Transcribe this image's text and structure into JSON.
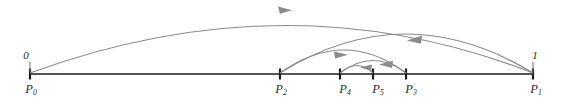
{
  "figure": {
    "name": "parameter-interval-subdivision-diagram",
    "width": 566,
    "height": 104,
    "background": "#ffffff",
    "axis_color": "#1c1c1c",
    "arc_color": "#8a8a8a",
    "label_color": "#2b2b2b"
  },
  "axis": {
    "y": 74,
    "x_start": 30,
    "x_end": 534
  },
  "points": [
    {
      "id": "P0",
      "base": "P",
      "subscript": "0",
      "label": "P₀",
      "x": 30,
      "value_label": "0",
      "has_value_label": true
    },
    {
      "id": "P2",
      "base": "P",
      "subscript": "2",
      "label": "P₂",
      "x": 280,
      "value_label": "",
      "has_value_label": false
    },
    {
      "id": "P4",
      "base": "P",
      "subscript": "4",
      "label": "P₄",
      "x": 340,
      "value_label": "",
      "has_value_label": false
    },
    {
      "id": "P5",
      "base": "P",
      "subscript": "5",
      "label": "P₅",
      "x": 373,
      "value_label": "",
      "has_value_label": false
    },
    {
      "id": "P3",
      "base": "P",
      "subscript": "3",
      "label": "P₃",
      "x": 406,
      "value_label": "",
      "has_value_label": false
    },
    {
      "id": "P1",
      "base": "P",
      "subscript": "1",
      "label": "P₁",
      "x": 533,
      "value_label": "1",
      "has_value_label": true
    }
  ],
  "arcs": [
    {
      "id": "arc-p0-p1",
      "from": "P0",
      "to": "P1",
      "direction": "right",
      "apex_y": 9,
      "arrow_x": 285,
      "arrow_y": 11
    },
    {
      "id": "arc-p1-p2",
      "from": "P1",
      "to": "P2",
      "direction": "left",
      "apex_y": 34,
      "arrow_x": 415,
      "arrow_y": 40
    },
    {
      "id": "arc-p2-p3",
      "from": "P2",
      "to": "P3",
      "direction": "right",
      "apex_y": 50,
      "arrow_x": 341,
      "arrow_y": 55
    },
    {
      "id": "arc-p3-p4",
      "from": "P3",
      "to": "P4",
      "direction": "left",
      "apex_y": 61,
      "arrow_x": 386,
      "arrow_y": 65
    },
    {
      "id": "arc-p4-p5",
      "from": "P4",
      "to": "P5",
      "direction": "left",
      "apex_y": 66,
      "arrow_x": 366,
      "arrow_y": 68
    }
  ]
}
